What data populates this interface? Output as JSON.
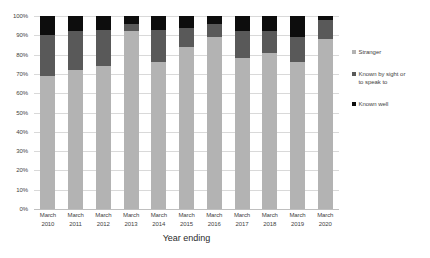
{
  "chart_data": {
    "type": "bar",
    "stacked": true,
    "normalized": "100%",
    "title": "",
    "xlabel": "Year ending",
    "ylabel": "",
    "ylim": [
      0,
      100
    ],
    "grid": true,
    "legend_position": "right",
    "categories": [
      "March 2010",
      "March 2011",
      "March 2012",
      "March 2013",
      "March 2014",
      "March 2015",
      "March 2016",
      "March 2017",
      "March 2018",
      "March 2019",
      "March 2020"
    ],
    "category_lines": [
      [
        "March",
        "2010"
      ],
      [
        "March",
        "2011"
      ],
      [
        "March",
        "2012"
      ],
      [
        "March",
        "2013"
      ],
      [
        "March",
        "2014"
      ],
      [
        "March",
        "2015"
      ],
      [
        "March",
        "2016"
      ],
      [
        "March",
        "2017"
      ],
      [
        "March",
        "2018"
      ],
      [
        "March",
        "2019"
      ],
      [
        "March",
        "2020"
      ]
    ],
    "ytick_labels": [
      "100%",
      "90%",
      "80%",
      "70%",
      "60%",
      "50%",
      "40%",
      "30%",
      "20%",
      "10%",
      "0%"
    ],
    "ytick_values": [
      100,
      90,
      80,
      70,
      60,
      50,
      40,
      30,
      20,
      10,
      0
    ],
    "series": [
      {
        "name": "Stranger",
        "color": "#b3b3b3",
        "values": [
          69,
          72,
          74,
          92,
          76,
          84,
          89,
          78,
          81,
          76,
          88
        ]
      },
      {
        "name": "Known by sight or to speak to",
        "color": "#595959",
        "values": [
          21,
          20,
          19,
          4,
          17,
          10,
          7,
          14,
          11,
          13,
          10
        ]
      },
      {
        "name": "Known well",
        "color": "#0d0d0d",
        "values": [
          10,
          8,
          7,
          4,
          7,
          6,
          4,
          8,
          8,
          11,
          2
        ]
      }
    ],
    "legend": [
      {
        "label": "Stranger",
        "color": "#b3b3b3",
        "lines": [
          "Stranger"
        ]
      },
      {
        "label": "Known by sight or to speak to",
        "color": "#595959",
        "lines": [
          "Known by sight or",
          "to speak to"
        ]
      },
      {
        "label": "Known well",
        "color": "#0d0d0d",
        "lines": [
          "Known well"
        ]
      }
    ]
  },
  "axis": {
    "x_title": "Year ending"
  },
  "colors": {
    "gridline": "#d9d9d9",
    "tick_text": "#3f3f3f",
    "background": "#ffffff"
  }
}
